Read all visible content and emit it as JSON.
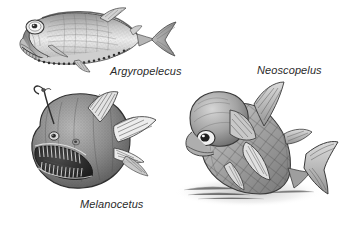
{
  "plate": {
    "kind": "scientific-illustration-plate",
    "subject": "deep-sea fishes",
    "technique": "grayscale pen-and-ink stipple drawing",
    "background_color": "#ffffff",
    "ink_color": "#2b2b2b",
    "figure_count": 3
  },
  "figures": [
    {
      "id": "argyropelecus",
      "label": "Argyropelecus",
      "common_name": "hatchetfish",
      "pose": "lateral view, head to the left",
      "features": [
        "large upward-directed tubular eye",
        "deep laterally compressed hatchet-shaped body",
        "row of ventral photophores along the belly keel",
        "upturned mouth with fine teeth",
        "forked caudal fin"
      ]
    },
    {
      "id": "melanocetus",
      "label": "Melanocetus",
      "common_name": "blackdevil anglerfish",
      "pose": "three-quarter view, head to the left, mouth gaping",
      "features": [
        "illicium lure stalk curving above the head",
        "globular body",
        "enormous gaping jaw with long needle-like fangs",
        "small eye",
        "fan-shaped dorsal, pectoral and caudal fins with visible rays"
      ]
    },
    {
      "id": "neoscopelus",
      "label": "Neoscopelus",
      "common_name": "blackchin lanternfish",
      "pose": "arched body, head lowered to the left, tail raised right",
      "features": [
        "large round eye",
        "prominent diamond cross-hatched scale pattern",
        "large bulbous head",
        "forked caudal fin",
        "soft cast shadow beneath the body"
      ]
    }
  ],
  "labels": {
    "argyropelecus": "Argyropelecus",
    "neoscopelus": "Neoscopelus",
    "melanocetus": "Melanocetus"
  }
}
